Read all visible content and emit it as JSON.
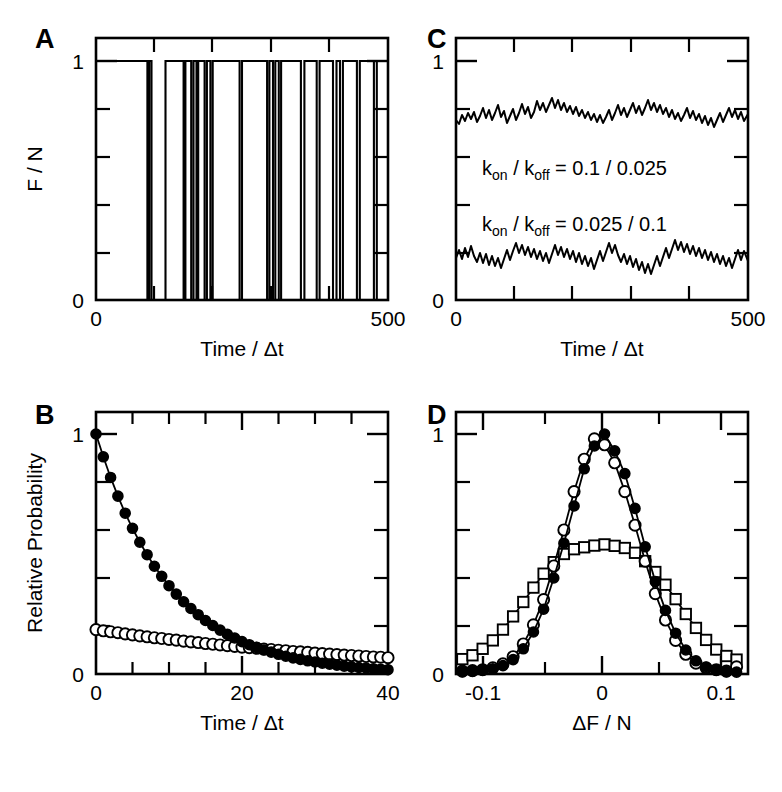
{
  "figure": {
    "background": "#ffffff",
    "ink": "#000000",
    "width": 782,
    "height": 792
  },
  "panels": [
    {
      "id": "A",
      "letter": "A",
      "xlabel": "Time / Δt",
      "ylabel": "F / N",
      "xticks": [
        "0",
        "500"
      ],
      "yticks": [
        "0",
        "1"
      ]
    },
    {
      "id": "B",
      "letter": "B",
      "xlabel": "Time / Δt",
      "ylabel": "Relative Probability",
      "xticks": [
        "0",
        "20",
        "40"
      ],
      "yticks": [
        "0",
        "1"
      ]
    },
    {
      "id": "C",
      "letter": "C",
      "xlabel": "Time / Δt",
      "ylabel": "",
      "xticks": [
        "0",
        "500"
      ],
      "yticks": [
        "0",
        "1"
      ],
      "annotations": [
        {
          "id": "upper",
          "prefix": "k",
          "sub1": "on",
          "mid": " / k",
          "sub2": "off",
          "suffix": " = 0.1 / 0.025",
          "full_text": "k_on / k_off = 0.1 / 0.025"
        },
        {
          "id": "lower",
          "prefix": "k",
          "sub1": "on",
          "mid": " / k",
          "sub2": "off",
          "suffix": " = 0.025 / 0.1",
          "full_text": "k_on / k_off = 0.025 / 0.1"
        }
      ]
    },
    {
      "id": "D",
      "letter": "D",
      "xlabel": "ΔF / N",
      "ylabel": "",
      "xticks": [
        "-0.1",
        "0",
        "0.1"
      ],
      "yticks": [
        "0",
        "1"
      ]
    }
  ],
  "chart_data": [
    {
      "id": "A",
      "type": "line",
      "title": "",
      "subtitle": "Two-state telegraph trace of fractional fluorescence",
      "xlabel": "Time / Δt",
      "ylabel": "F / N",
      "xlim": [
        0,
        500
      ],
      "ylim": [
        0,
        1
      ],
      "xticks": [
        0,
        500
      ],
      "yticks": [
        0,
        1
      ],
      "grid": false,
      "legend": "none",
      "series": [
        {
          "name": "telegraph",
          "description": "binary signal switching between 1 (on) and 0 (off)",
          "high_value": 1,
          "low_value": 0,
          "segments": [
            [
              0,
              88,
              1
            ],
            [
              88,
              91,
              0
            ],
            [
              91,
              96,
              1
            ],
            [
              96,
              119,
              0
            ],
            [
              119,
              150,
              1
            ],
            [
              150,
              153,
              0
            ],
            [
              153,
              163,
              1
            ],
            [
              163,
              167,
              0
            ],
            [
              167,
              172,
              1
            ],
            [
              172,
              175,
              0
            ],
            [
              175,
              186,
              1
            ],
            [
              186,
              190,
              0
            ],
            [
              190,
              196,
              1
            ],
            [
              196,
              200,
              0
            ],
            [
              200,
              246,
              1
            ],
            [
              246,
              250,
              0
            ],
            [
              250,
              293,
              1
            ],
            [
              293,
              297,
              0
            ],
            [
              297,
              303,
              1
            ],
            [
              303,
              307,
              0
            ],
            [
              307,
              313,
              1
            ],
            [
              313,
              317,
              0
            ],
            [
              317,
              351,
              1
            ],
            [
              351,
              357,
              0
            ],
            [
              357,
              378,
              1
            ],
            [
              378,
              383,
              0
            ],
            [
              383,
              406,
              1
            ],
            [
              406,
              412,
              0
            ],
            [
              412,
              418,
              1
            ],
            [
              418,
              423,
              0
            ],
            [
              423,
              447,
              1
            ],
            [
              447,
              452,
              0
            ],
            [
              452,
              476,
              1
            ],
            [
              476,
              481,
              0
            ],
            [
              481,
              500,
              1
            ]
          ]
        }
      ]
    },
    {
      "id": "B",
      "type": "line",
      "title": "",
      "subtitle": "Dwell-time distributions (relative probability vs time)",
      "xlabel": "Time / Δt",
      "ylabel": "Relative Probability",
      "xlim": [
        0,
        40
      ],
      "ylim": [
        0,
        1
      ],
      "xticks": [
        0,
        20,
        40
      ],
      "yticks": [
        0,
        1
      ],
      "grid": false,
      "legend": "none",
      "x": [
        0,
        1,
        2,
        3,
        4,
        5,
        6,
        7,
        8,
        9,
        10,
        11,
        12,
        13,
        14,
        15,
        16,
        17,
        18,
        19,
        20,
        21,
        22,
        23,
        24,
        25,
        26,
        27,
        28,
        29,
        30,
        31,
        32,
        33,
        34,
        35,
        36,
        37,
        38,
        39,
        40
      ],
      "series": [
        {
          "name": "filled-circles",
          "marker": "filled-circle",
          "decay_rate": 0.1,
          "values": [
            1.0,
            0.905,
            0.819,
            0.741,
            0.67,
            0.607,
            0.549,
            0.497,
            0.449,
            0.407,
            0.368,
            0.333,
            0.301,
            0.273,
            0.247,
            0.223,
            0.202,
            0.183,
            0.165,
            0.15,
            0.135,
            0.122,
            0.111,
            0.1,
            0.091,
            0.082,
            0.074,
            0.067,
            0.061,
            0.055,
            0.05,
            0.045,
            0.041,
            0.037,
            0.033,
            0.03,
            0.027,
            0.025,
            0.022,
            0.02,
            0.018
          ]
        },
        {
          "name": "open-circles",
          "marker": "open-circle",
          "decay_rate": 0.025,
          "values": [
            0.185,
            0.18,
            0.176,
            0.172,
            0.167,
            0.163,
            0.159,
            0.155,
            0.151,
            0.148,
            0.144,
            0.141,
            0.137,
            0.134,
            0.131,
            0.127,
            0.124,
            0.121,
            0.118,
            0.115,
            0.112,
            0.11,
            0.107,
            0.104,
            0.102,
            0.099,
            0.097,
            0.094,
            0.092,
            0.09,
            0.087,
            0.085,
            0.083,
            0.081,
            0.079,
            0.077,
            0.075,
            0.073,
            0.071,
            0.07,
            0.068
          ]
        }
      ]
    },
    {
      "id": "C",
      "type": "line",
      "title": "",
      "subtitle": "Fluctuating fluorescence traces for two rate-constant pairs",
      "xlabel": "Time / Δt",
      "ylabel": "F / N",
      "xlim": [
        0,
        500
      ],
      "ylim": [
        0,
        1
      ],
      "xticks": [
        0,
        500
      ],
      "yticks": [
        0,
        1
      ],
      "grid": false,
      "legend": "none",
      "series": [
        {
          "name": "upper-trace",
          "label": "k_on / k_off = 0.1 / 0.025",
          "baseline": 0.8,
          "noise_amplitude": 0.045
        },
        {
          "name": "lower-trace",
          "label": "k_on / k_off = 0.025 / 0.1",
          "baseline": 0.22,
          "noise_amplitude": 0.05
        }
      ]
    },
    {
      "id": "D",
      "type": "line",
      "title": "",
      "subtitle": "Distributions of fluorescence fluctuations ΔF/N",
      "xlabel": "ΔF / N",
      "ylabel": "Relative Probability",
      "xlim": [
        -0.115,
        0.115
      ],
      "ylim": [
        0,
        1.05
      ],
      "xticks": [
        -0.1,
        0,
        0.1
      ],
      "yticks": [
        0,
        1
      ],
      "grid": false,
      "legend": "none",
      "x": [
        -0.11,
        -0.102,
        -0.094,
        -0.086,
        -0.078,
        -0.07,
        -0.062,
        -0.054,
        -0.046,
        -0.038,
        -0.03,
        -0.022,
        -0.014,
        -0.006,
        0.002,
        0.01,
        0.018,
        0.026,
        0.034,
        0.042,
        0.05,
        0.058,
        0.066,
        0.074,
        0.082,
        0.09,
        0.098,
        0.106
      ],
      "series": [
        {
          "name": "filled-circles",
          "marker": "filled-circle",
          "values": [
            0.01,
            0.012,
            0.016,
            0.022,
            0.035,
            0.06,
            0.105,
            0.175,
            0.27,
            0.4,
            0.545,
            0.7,
            0.855,
            0.95,
            1.0,
            0.93,
            0.835,
            0.69,
            0.53,
            0.385,
            0.265,
            0.17,
            0.1,
            0.055,
            0.028,
            0.016,
            0.01,
            0.008
          ]
        },
        {
          "name": "open-circles",
          "marker": "open-circle",
          "values": [
            0.012,
            0.014,
            0.018,
            0.026,
            0.042,
            0.072,
            0.125,
            0.205,
            0.31,
            0.45,
            0.6,
            0.76,
            0.895,
            0.98,
            0.955,
            0.88,
            0.76,
            0.62,
            0.47,
            0.335,
            0.225,
            0.14,
            0.082,
            0.045,
            0.026,
            0.018,
            0.012,
            0.03
          ]
        },
        {
          "name": "open-squares",
          "marker": "open-square",
          "values": [
            0.062,
            0.078,
            0.105,
            0.14,
            0.185,
            0.24,
            0.3,
            0.36,
            0.418,
            0.466,
            0.5,
            0.52,
            0.528,
            0.535,
            0.54,
            0.534,
            0.525,
            0.505,
            0.47,
            0.425,
            0.372,
            0.312,
            0.25,
            0.192,
            0.142,
            0.102,
            0.075,
            0.06
          ]
        }
      ]
    }
  ]
}
